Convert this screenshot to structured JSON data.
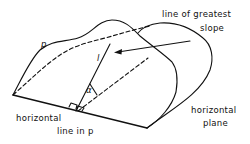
{
  "figure": {
    "type": "geometry-diagram"
  },
  "labels": {
    "plane_p": "p",
    "line_l": "l",
    "angle": "α",
    "line_of_greatest_slope_line1": "line of greatest",
    "line_of_greatest_slope_line2": "slope",
    "horizontal_line_line1": "horizontal",
    "horizontal_line_line2": "line in p",
    "horizontal_plane_line1": "horizontal",
    "horizontal_plane_line2": "plane"
  },
  "colors": {
    "ink": "#111111",
    "background": "#ffffff"
  }
}
